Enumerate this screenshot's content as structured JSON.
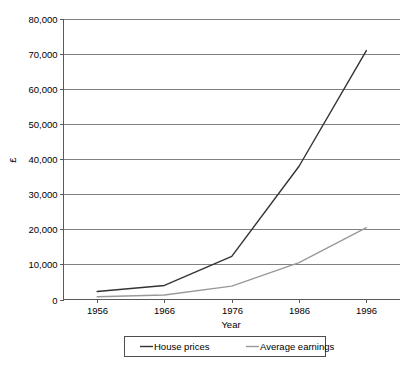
{
  "chart_data": {
    "type": "line",
    "title": "",
    "xlabel": "Year",
    "ylabel": "£",
    "x": [
      1956,
      1966,
      1976,
      1986,
      1996
    ],
    "categories": [
      "1956",
      "1966",
      "1976",
      "1986",
      "1996"
    ],
    "xlim": [
      1951,
      2001
    ],
    "ylim": [
      0,
      80000
    ],
    "ytick_values": [
      0,
      10000,
      20000,
      30000,
      40000,
      50000,
      60000,
      70000,
      80000
    ],
    "ytick_labels": [
      "0",
      "10,000",
      "20,000",
      "30,000",
      "40,000",
      "50,000",
      "60,000",
      "70,000",
      "80,000"
    ],
    "xtick_labels": [
      "1956",
      "1966",
      "1976",
      "1986",
      "1996"
    ],
    "grid": "horizontal",
    "legend_position": "bottom",
    "series": [
      {
        "name": "House prices",
        "color": "#333333",
        "values": [
          2300,
          4000,
          12300,
          38000,
          71000
        ]
      },
      {
        "name": "Average earnings",
        "color": "#999999",
        "values": [
          800,
          1300,
          3800,
          10500,
          20500
        ]
      }
    ]
  },
  "axes": {
    "y_title": "£",
    "x_title": "Year"
  },
  "legend": {
    "items": [
      {
        "label": "House prices",
        "color": "#333333"
      },
      {
        "label": "Average earnings",
        "color": "#999999"
      }
    ]
  }
}
